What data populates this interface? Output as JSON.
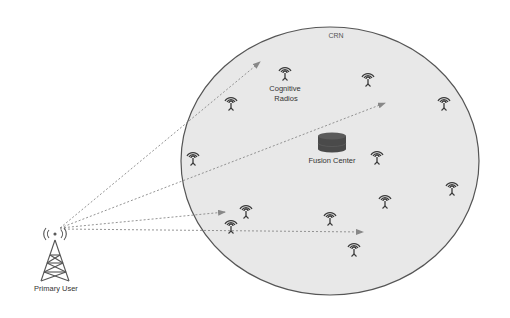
{
  "diagram": {
    "network_label": "CRN",
    "primary_user": {
      "label": "Primary User",
      "icon": "cell-tower-icon",
      "x": 55,
      "y": 255
    },
    "fusion_center": {
      "label": "Fusion Center",
      "icon": "database-cylinder-icon",
      "x": 333,
      "y": 145
    },
    "cognitive_radios_label": {
      "line1": "Cognitive",
      "line2": "Radios"
    },
    "cognitive_radios": [
      {
        "id": 1,
        "x": 285,
        "y": 72
      },
      {
        "id": 2,
        "x": 368,
        "y": 78
      },
      {
        "id": 3,
        "x": 231,
        "y": 102
      },
      {
        "id": 4,
        "x": 444,
        "y": 102
      },
      {
        "id": 5,
        "x": 193,
        "y": 157
      },
      {
        "id": 6,
        "x": 377,
        "y": 156
      },
      {
        "id": 7,
        "x": 452,
        "y": 187
      },
      {
        "id": 8,
        "x": 385,
        "y": 200
      },
      {
        "id": 9,
        "x": 246,
        "y": 210
      },
      {
        "id": 10,
        "x": 330,
        "y": 217
      },
      {
        "id": 11,
        "x": 231,
        "y": 225
      },
      {
        "id": 12,
        "x": 354,
        "y": 248
      }
    ],
    "signal_arrows": [
      {
        "from": [
          60,
          228
        ],
        "to": [
          260,
          62
        ]
      },
      {
        "from": [
          60,
          228
        ],
        "to": [
          385,
          103
        ]
      },
      {
        "from": [
          60,
          228
        ],
        "to": [
          225,
          212
        ]
      },
      {
        "from": [
          60,
          229
        ],
        "to": [
          363,
          232
        ]
      }
    ],
    "colors": {
      "network_fill": "#e8e8e8",
      "network_stroke": "#555555",
      "icon": "#3a3a3a",
      "arrow": "#888888",
      "fusion_center": "#4a4a4a"
    }
  }
}
